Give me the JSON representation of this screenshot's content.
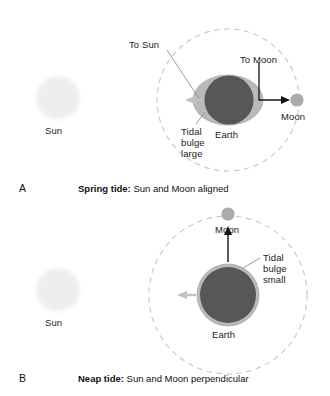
{
  "figure": {
    "panels": [
      {
        "letter": "A",
        "caption_bold": "Spring tide:",
        "caption_rest": "Sun and Moon aligned",
        "sun_label": "Sun",
        "earth_label": "Earth",
        "moon_label": "Moon",
        "to_sun_label": "To Sun",
        "to_moon_label": "To Moon",
        "bulge_label_line1": "Tidal",
        "bulge_label_line2": "bulge",
        "bulge_label_line3": "large",
        "bulge_shape": "elongated-ellipse",
        "moon_position": "right"
      },
      {
        "letter": "B",
        "caption_bold": "Neap tide:",
        "caption_rest": "Sun and Moon perpendicular",
        "sun_label": "Sun",
        "earth_label": "Earth",
        "moon_label": "Moon",
        "bulge_label_line1": "Tidal",
        "bulge_label_line2": "bulge",
        "bulge_label_line3": "small",
        "bulge_shape": "thin-ring",
        "moon_position": "top"
      }
    ]
  },
  "colors": {
    "earth_fill": "#575757",
    "bulge_fill": "#b9b9b9",
    "moon_fill": "#ababab",
    "sun_fill": "#eeeeee",
    "orbit_dash": "#c9c6c0",
    "arrow_dark": "#141414",
    "arrow_light": "#c2c2c2",
    "leader_line": "#9b9b9b",
    "text": "#1a1a1a",
    "background": "#ffffff"
  }
}
